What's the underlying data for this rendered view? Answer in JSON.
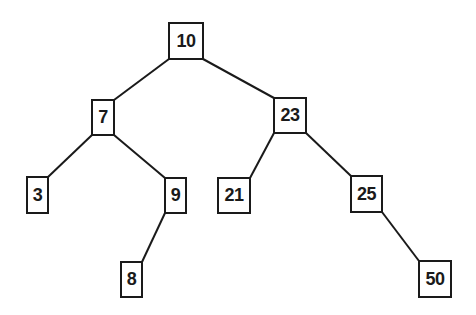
{
  "diagram": {
    "type": "binary-search-tree",
    "colors": {
      "stroke": "#1a1a1a",
      "background": "#ffffff",
      "text": "#1a1a1a"
    },
    "nodes": [
      {
        "id": "n10",
        "label": "10"
      },
      {
        "id": "n7",
        "label": "7"
      },
      {
        "id": "n23",
        "label": "23"
      },
      {
        "id": "n3",
        "label": "3"
      },
      {
        "id": "n9",
        "label": "9"
      },
      {
        "id": "n21",
        "label": "21"
      },
      {
        "id": "n25",
        "label": "25"
      },
      {
        "id": "n8",
        "label": "8"
      },
      {
        "id": "n50",
        "label": "50"
      }
    ],
    "edges": [
      {
        "from": "n10",
        "to": "n7"
      },
      {
        "from": "n10",
        "to": "n23"
      },
      {
        "from": "n7",
        "to": "n3"
      },
      {
        "from": "n7",
        "to": "n9"
      },
      {
        "from": "n23",
        "to": "n21"
      },
      {
        "from": "n23",
        "to": "n25"
      },
      {
        "from": "n9",
        "to": "n8"
      },
      {
        "from": "n25",
        "to": "n50"
      }
    ]
  }
}
